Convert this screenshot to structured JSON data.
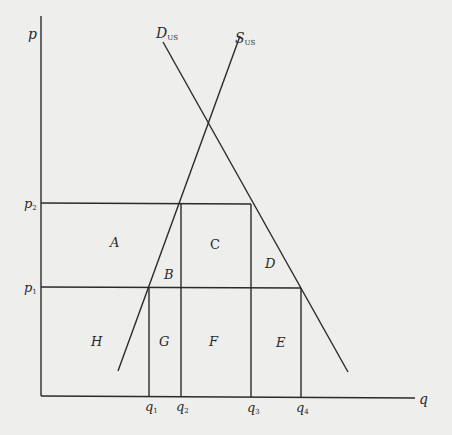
{
  "diagram": {
    "type": "supply-demand",
    "axes": {
      "y_label": "p",
      "x_label": "q"
    },
    "curves": {
      "demand": {
        "label": "D",
        "subscript": "US"
      },
      "supply": {
        "label": "S",
        "subscript": "US"
      }
    },
    "price_levels": [
      {
        "label": "p",
        "subscript": "2"
      },
      {
        "label": "p",
        "subscript": "1"
      }
    ],
    "quantity_levels": [
      {
        "label": "q",
        "subscript": "1"
      },
      {
        "label": "q",
        "subscript": "2"
      },
      {
        "label": "q",
        "subscript": "3"
      },
      {
        "label": "q",
        "subscript": "4"
      }
    ],
    "regions": {
      "A": "A",
      "B": "B",
      "C": "C",
      "D": "D",
      "E": "E",
      "F": "F",
      "G": "G",
      "H": "H"
    },
    "colors": {
      "background": "#eeeeec",
      "line": "#2a2a2a"
    }
  }
}
